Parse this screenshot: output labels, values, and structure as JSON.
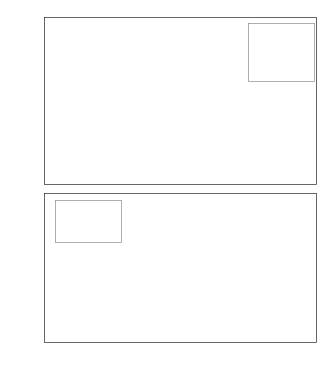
{
  "figure": {
    "width": 328,
    "height": 388,
    "background": "#ffffff",
    "line_color": "#141414",
    "grid_color": "#e6e6e6",
    "axis_color": "#262626",
    "title_remnant": ""
  },
  "chart_data": [
    {
      "type": "line",
      "id": "top-subplot",
      "title": "",
      "xlabel": "",
      "ylabel": "δeRx, δeLx, Δδx, (Δ)",
      "ylabel_parts": [
        {
          "base": "δ",
          "sub": "eRx",
          "sep": ", "
        },
        {
          "base": "δ",
          "sub": "eLx",
          "sep": ", "
        },
        {
          "base": "Δδ",
          "sub": "x",
          "sep": ", "
        },
        {
          "base": "(Δ)",
          "sub": "",
          "sep": ""
        }
      ],
      "xlim": [
        -1,
        1
      ],
      "ylim": [
        -10,
        15
      ],
      "xticks": [
        -1,
        -0.5,
        0,
        0.5,
        1
      ],
      "xticklabels": [
        "-1",
        "-0.5",
        "0",
        "0.5",
        "1"
      ],
      "yticks": [
        -10,
        -5,
        0,
        5,
        10,
        15
      ],
      "yticklabels": [
        "-10",
        "-5",
        "0",
        "5",
        "10",
        "15"
      ],
      "grid": true,
      "xticklabels_visible": false,
      "legend_position": "top-right",
      "series": [
        {
          "name": "δeRx",
          "label_base": "δ",
          "label_sub": "eRx",
          "style": "dashed",
          "x": [
            -1,
            1
          ],
          "values": [
            10.2,
            -9.7
          ]
        },
        {
          "name": "δeLx",
          "label_base": "δ",
          "label_sub": "eLx",
          "style": "dotted",
          "x": [
            -1,
            1
          ],
          "values": [
            3.5,
            -3.8
          ]
        },
        {
          "name": "Δδx",
          "label_base": "Δδ",
          "label_sub": "x",
          "style": "solid",
          "x": [
            -1,
            1
          ],
          "values": [
            6.8,
            -6.0
          ]
        }
      ]
    },
    {
      "type": "line",
      "id": "bottom-subplot",
      "title": "",
      "xlabel": "x0 (mm)",
      "xlabel_base": "x",
      "xlabel_sub": "0",
      "xlabel_unit": "(mm)",
      "ylabel": "x2R, x2L, (mm)",
      "ylabel_parts": [
        {
          "base": "x",
          "sub": "2R",
          "sep": ", "
        },
        {
          "base": "x",
          "sub": "2L",
          "sep": ", "
        },
        {
          "base": "(mm)",
          "sub": "",
          "sep": ""
        }
      ],
      "xlim": [
        -1,
        1
      ],
      "ylim": [
        -20,
        20
      ],
      "xticks": [
        -1,
        -0.5,
        0,
        0.5,
        1
      ],
      "xticklabels": [
        "-1",
        "-0.5",
        "0",
        "0.5",
        "1"
      ],
      "yticks": [
        -20,
        -10,
        0,
        10,
        20
      ],
      "yticklabels": [
        "-20",
        "-10",
        "0",
        "10",
        "20"
      ],
      "grid": true,
      "xticklabels_visible": true,
      "legend_position": "top-left",
      "series": [
        {
          "name": "x2R",
          "label_base": "x",
          "label_sub": "2R",
          "style": "dashed",
          "x": [
            -1,
            1
          ],
          "values": [
            -16.8,
            15.2
          ]
        },
        {
          "name": "x2L",
          "label_base": "x",
          "label_sub": "2L",
          "style": "dotted",
          "x": [
            -1,
            1
          ],
          "values": [
            -14.0,
            15.2
          ]
        }
      ]
    }
  ]
}
